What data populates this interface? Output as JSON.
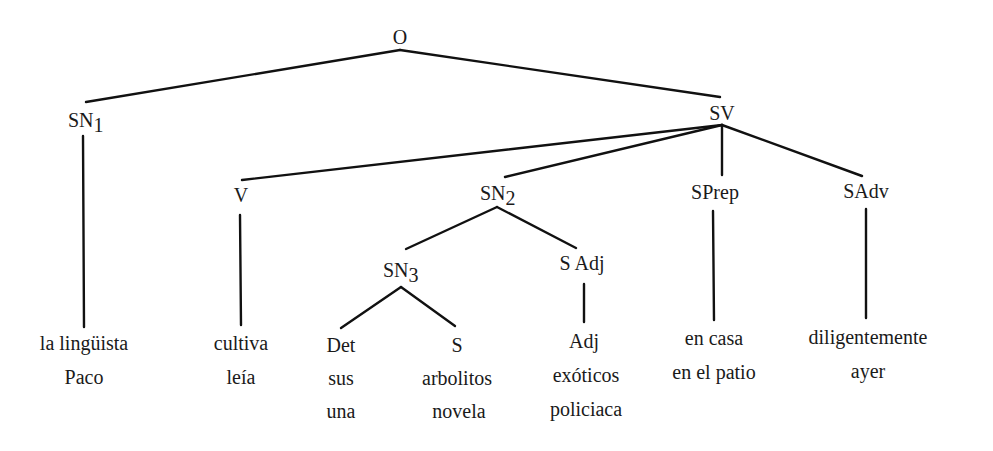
{
  "tree": {
    "root": {
      "label": "O"
    },
    "sn1": {
      "label": "SN",
      "sub": "1",
      "words": [
        "la lingüista",
        "Paco"
      ]
    },
    "sv": {
      "label": "SV"
    },
    "v": {
      "label": "V",
      "words": [
        "cultiva",
        "leía"
      ]
    },
    "sn2": {
      "label": "SN",
      "sub": "2"
    },
    "sn3": {
      "label": "SN",
      "sub": "3"
    },
    "det": {
      "label": "Det",
      "words": [
        "sus",
        "una"
      ]
    },
    "s": {
      "label": "S",
      "words": [
        "arbolitos",
        "novela"
      ]
    },
    "sadj": {
      "label": "S Adj"
    },
    "adj": {
      "label": "Adj",
      "words": [
        "exóticos",
        "policiaca"
      ]
    },
    "sprep": {
      "label": "SPrep",
      "words": [
        "en casa",
        "en el patio"
      ]
    },
    "sadv": {
      "label": "SAdv",
      "words": [
        "diligentemente",
        "ayer"
      ]
    }
  }
}
